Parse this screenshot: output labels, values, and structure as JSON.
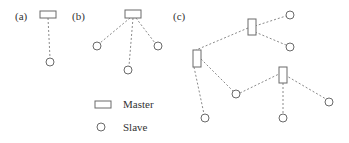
{
  "panels": {
    "a": {
      "label": "(a)"
    },
    "b": {
      "label": "(b)"
    },
    "c": {
      "label": "(c)"
    }
  },
  "legend": {
    "master": {
      "icon": "rectangle",
      "label": "Master"
    },
    "slave": {
      "icon": "circle",
      "label": "Slave"
    }
  },
  "colors": {
    "node_stroke": "#6a6a6a",
    "edge_stroke": "#8a8a8a",
    "text": "#333333"
  }
}
